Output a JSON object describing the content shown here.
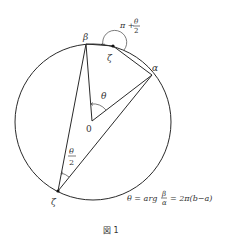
{
  "figure": {
    "caption": "図 1",
    "circle": {
      "cx": 93,
      "cy": 122,
      "r": 78
    },
    "points": {
      "beta": {
        "label": "β",
        "x": 86,
        "y": 44
      },
      "zeta_top": {
        "label": "ζ",
        "x": 113,
        "y": 46
      },
      "alpha": {
        "label": "α",
        "x": 152,
        "y": 75
      },
      "origin": {
        "label": "0",
        "x": 92,
        "y": 121
      },
      "zeta_bottom": {
        "label": "ζ",
        "x": 58,
        "y": 191
      }
    },
    "angle_labels": {
      "center": "θ",
      "inscribed_num": "θ",
      "inscribed_den": "2",
      "top_prefix": "π +",
      "top_num": "θ",
      "top_den": "2"
    },
    "equation": {
      "lhs": "θ = arg",
      "frac_num": "β",
      "frac_den": "α",
      "rhs": "= 2π(b−a)"
    },
    "colors": {
      "ink": "#2a2a2a",
      "text": "#333333",
      "background": "#ffffff"
    }
  }
}
